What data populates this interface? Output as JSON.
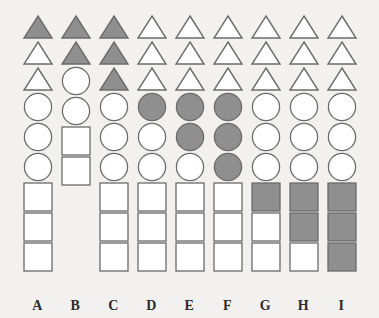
{
  "figure": {
    "title": "",
    "background_color": "#f2f1ef",
    "fill_color": "#8f8f8f",
    "outline_color": "#6b6b6b",
    "label_color": "#2b2b2b",
    "rows_order": [
      "triangles",
      "circles",
      "squares"
    ],
    "column_count": 9,
    "shapes_per_group": 3
  },
  "chart_data": {
    "type": "table",
    "title": "",
    "xlabel": "",
    "ylabel": "",
    "categories": [
      "A",
      "B",
      "C",
      "D",
      "E",
      "F",
      "G",
      "H",
      "I"
    ],
    "series": [
      {
        "name": "triangles",
        "values": [
          1,
          2,
          3,
          0,
          0,
          0,
          0,
          0,
          0
        ]
      },
      {
        "name": "circles",
        "values": [
          0,
          0,
          0,
          1,
          2,
          3,
          0,
          0,
          0
        ]
      },
      {
        "name": "squares",
        "values": [
          0,
          0,
          0,
          0,
          0,
          0,
          1,
          2,
          3
        ]
      }
    ],
    "totals_per_column": [
      3,
      2,
      3,
      3,
      3,
      3,
      3,
      3,
      3
    ]
  },
  "columns": [
    {
      "label": "A",
      "triangles": [
        "filled",
        "empty",
        "empty"
      ],
      "circles": [
        "empty",
        "empty",
        "empty"
      ],
      "squares": [
        "empty",
        "empty",
        "empty"
      ]
    },
    {
      "label": "B",
      "triangles": [
        "filled",
        "filled"
      ],
      "circles": [
        "empty",
        "empty"
      ],
      "squares": [
        "empty",
        "empty"
      ]
    },
    {
      "label": "C",
      "triangles": [
        "filled",
        "filled",
        "filled"
      ],
      "circles": [
        "empty",
        "empty",
        "empty"
      ],
      "squares": [
        "empty",
        "empty",
        "empty"
      ]
    },
    {
      "label": "D",
      "triangles": [
        "empty",
        "empty",
        "empty"
      ],
      "circles": [
        "filled",
        "empty",
        "empty"
      ],
      "squares": [
        "empty",
        "empty",
        "empty"
      ]
    },
    {
      "label": "E",
      "triangles": [
        "empty",
        "empty",
        "empty"
      ],
      "circles": [
        "filled",
        "filled",
        "empty"
      ],
      "squares": [
        "empty",
        "empty",
        "empty"
      ]
    },
    {
      "label": "F",
      "triangles": [
        "empty",
        "empty",
        "empty"
      ],
      "circles": [
        "filled",
        "filled",
        "filled"
      ],
      "squares": [
        "empty",
        "empty",
        "empty"
      ]
    },
    {
      "label": "G",
      "triangles": [
        "empty",
        "empty",
        "empty"
      ],
      "circles": [
        "empty",
        "empty",
        "empty"
      ],
      "squares": [
        "filled",
        "empty",
        "empty"
      ]
    },
    {
      "label": "H",
      "triangles": [
        "empty",
        "empty",
        "empty"
      ],
      "circles": [
        "empty",
        "empty",
        "empty"
      ],
      "squares": [
        "filled",
        "filled",
        "empty"
      ]
    },
    {
      "label": "I",
      "triangles": [
        "empty",
        "empty",
        "empty"
      ],
      "circles": [
        "empty",
        "empty",
        "empty"
      ],
      "squares": [
        "filled",
        "filled",
        "filled"
      ]
    }
  ]
}
